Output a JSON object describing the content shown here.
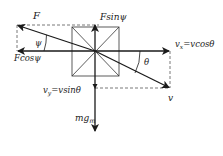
{
  "diagram": {
    "colors": {
      "stroke": "#1a1a1a",
      "box": "#333333",
      "dash": "#555555",
      "background": "#ffffff"
    },
    "labels": {
      "F": "F",
      "F_sin": "Fsinψ",
      "F_cos": "Fcosψ",
      "psi": "ψ",
      "theta": "θ",
      "vx": "vx=vcosθ",
      "vx_main": "v",
      "vx_sub": "x",
      "vx_eq": "=vcosθ",
      "vy_main": "v",
      "vy_sub": "y",
      "vy_eq": "=vsinθ",
      "v": "v",
      "mg_main": "mg",
      "mg_sub": "m"
    },
    "vectors": [
      {
        "name": "F",
        "from": [
          95,
          51
        ],
        "to": [
          17,
          25
        ]
      },
      {
        "name": "Fsinψ",
        "from": [
          95,
          51
        ],
        "to": [
          95,
          24
        ]
      },
      {
        "name": "Fcosψ",
        "from": [
          95,
          51
        ],
        "to": [
          17,
          51
        ]
      },
      {
        "name": "vx",
        "from": [
          95,
          51
        ],
        "to": [
          170,
          51
        ]
      },
      {
        "name": "v",
        "from": [
          95,
          51
        ],
        "to": [
          170,
          88
        ]
      },
      {
        "name": "vy",
        "from": [
          95,
          51
        ],
        "to": [
          95,
          88
        ]
      },
      {
        "name": "mg",
        "from": [
          95,
          51
        ],
        "to": [
          95,
          132
        ]
      }
    ]
  }
}
